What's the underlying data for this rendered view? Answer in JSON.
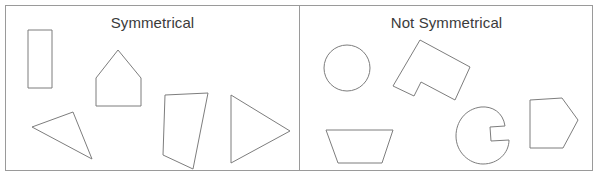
{
  "worksheet": {
    "background_color": "#ffffff",
    "frame_color": "#9a9a9a",
    "shape_stroke_color": "#7d7d7d",
    "shape_fill_color": "#ffffff",
    "title_color": "#3b3b3b"
  },
  "panels": [
    {
      "id": "symmetrical",
      "title": "Symmetrical",
      "shapes": [
        {
          "name": "rectangle",
          "label": "rectangle",
          "points": "28,30 52,30 52,88 28,88"
        },
        {
          "name": "pentagon-house",
          "label": "house pentagon",
          "points": "118,50 141,78 141,106 96,106 96,78"
        },
        {
          "name": "triangle-scalene",
          "label": "scalene triangle",
          "points": "32,127 73,112 92,159"
        },
        {
          "name": "quadrilateral",
          "label": "irregular quadrilateral",
          "points": "165,95 208,93 193,169 163,155"
        },
        {
          "name": "triangle-isosceles",
          "label": "isosceles triangle",
          "points": "231,95 290,131 231,163"
        }
      ]
    },
    {
      "id": "not-symmetrical",
      "title": "Not Symmetrical",
      "shapes": [
        {
          "name": "circle",
          "label": "circle",
          "type": "circle",
          "cx": 347,
          "cy": 68,
          "r": 23
        },
        {
          "name": "l-shape-rotated",
          "label": "rotated L shape",
          "points": "420,40 470,67 455,100 421,82 414,96 393,86"
        },
        {
          "name": "trapezoid",
          "label": "trapezoid",
          "points": "326,130 393,130 382,163 338,163"
        },
        {
          "name": "circle-with-notch",
          "label": "circle with notch",
          "type": "path",
          "d": "M 505,126 C 503,112 492,106 481,107 C 465,109 456,122 456,136 C 456,152 469,164 483,164 C 498,164 509,153 509,140 L 491,141 L 490,127 Z"
        },
        {
          "name": "pentagon-irregular",
          "label": "irregular pentagon",
          "points": "530,100 562,98 578,120 563,148 530,148"
        }
      ]
    }
  ]
}
